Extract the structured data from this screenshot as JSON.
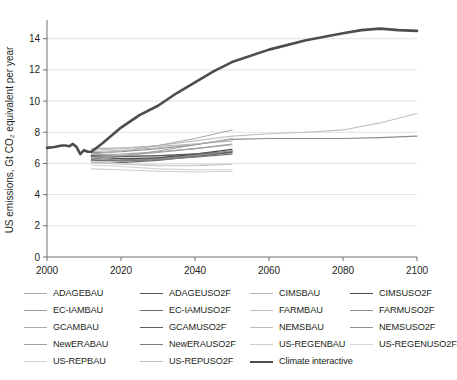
{
  "chart_data": {
    "type": "line",
    "title": "",
    "xlabel": "",
    "ylabel": "US emissions, Gt CO₂ equivalent per year",
    "xlim": [
      2000,
      2100
    ],
    "ylim": [
      0,
      15.2
    ],
    "xticks": [
      2000,
      2020,
      2040,
      2060,
      2080,
      2100
    ],
    "yticks": [
      0,
      2,
      4,
      6,
      8,
      10,
      12,
      14
    ],
    "grid": true,
    "legend_position": "bottom",
    "legend_columns": 4,
    "series": [
      {
        "name": "ADAGEBAU",
        "color": "#a8a8a8",
        "width": 1.1,
        "x": [
          2012,
          2020,
          2030,
          2040,
          2050
        ],
        "values": [
          6.55,
          6.6,
          6.75,
          6.95,
          7.2
        ]
      },
      {
        "name": "ADAGEUSO2F",
        "color": "#555555",
        "width": 1.4,
        "x": [
          2012,
          2020,
          2030,
          2040,
          2050
        ],
        "values": [
          6.45,
          6.3,
          6.35,
          6.5,
          6.75
        ]
      },
      {
        "name": "CIMSBAU",
        "color": "#b4b4b4",
        "width": 1.1,
        "x": [
          2012,
          2020,
          2030,
          2040,
          2050
        ],
        "values": [
          6.95,
          7.0,
          7.1,
          7.25,
          7.45
        ]
      },
      {
        "name": "CIMSUSO2F",
        "color": "#4a4a4a",
        "width": 1.4,
        "x": [
          2012,
          2020,
          2030,
          2040,
          2050
        ],
        "values": [
          6.2,
          6.2,
          6.35,
          6.6,
          6.9
        ]
      },
      {
        "name": "EC-IAMBAU",
        "color": "#9e9e9e",
        "width": 1.1,
        "x": [
          2012,
          2020,
          2030,
          2040,
          2050
        ],
        "values": [
          6.3,
          6.45,
          6.8,
          7.2,
          7.6
        ]
      },
      {
        "name": "EC-IAMUSO2F",
        "color": "#6b6b6b",
        "width": 1.2,
        "x": [
          2012,
          2020,
          2030,
          2040,
          2050
        ],
        "values": [
          6.1,
          6.05,
          6.2,
          6.45,
          6.7
        ]
      },
      {
        "name": "FARMBAU",
        "color": "#c0c0c0",
        "width": 1.1,
        "x": [
          2012,
          2020,
          2030,
          2040,
          2050,
          2060,
          2070,
          2080,
          2090,
          2100
        ],
        "values": [
          6.85,
          6.95,
          7.15,
          7.45,
          7.75,
          7.9,
          8.0,
          8.15,
          8.6,
          9.2
        ]
      },
      {
        "name": "FARMUSO2F",
        "color": "#8c8c8c",
        "width": 1.2,
        "x": [
          2012,
          2020,
          2030,
          2040,
          2050,
          2060,
          2070,
          2080,
          2090,
          2100
        ],
        "values": [
          6.7,
          6.75,
          6.95,
          7.2,
          7.55,
          7.6,
          7.6,
          7.6,
          7.65,
          7.75
        ]
      },
      {
        "name": "GCAMBAU",
        "color": "#ababab",
        "width": 1.1,
        "x": [
          2012,
          2020,
          2030,
          2040,
          2050
        ],
        "values": [
          6.6,
          6.8,
          7.15,
          7.6,
          8.15
        ]
      },
      {
        "name": "GCAMUSO2F",
        "color": "#5f5f5f",
        "width": 1.5,
        "x": [
          2012,
          2020,
          2030,
          2040,
          2050
        ],
        "values": [
          6.5,
          6.45,
          6.5,
          6.6,
          6.75
        ]
      },
      {
        "name": "NEMSBAU",
        "color": "#bdbdbd",
        "width": 1.1,
        "x": [
          2012,
          2020,
          2030,
          2040,
          2050
        ],
        "values": [
          6.75,
          6.85,
          7.0,
          7.25,
          7.55
        ]
      },
      {
        "name": "NEMSUSO2F",
        "color": "#8f8f8f",
        "width": 1.2,
        "x": [
          2012,
          2020,
          2030,
          2040,
          2050
        ],
        "values": [
          6.35,
          6.2,
          6.3,
          6.5,
          6.8
        ]
      },
      {
        "name": "NewERABAU",
        "color": "#a0a0a0",
        "width": 1.1,
        "x": [
          2012,
          2020,
          2030,
          2040,
          2050
        ],
        "values": [
          6.4,
          6.5,
          6.7,
          6.95,
          7.25
        ]
      },
      {
        "name": "NewERAUSO2F",
        "color": "#7a7a7a",
        "width": 1.2,
        "x": [
          2012,
          2020,
          2030,
          2040,
          2050
        ],
        "values": [
          6.25,
          6.15,
          6.25,
          6.4,
          6.6
        ]
      },
      {
        "name": "US-REGENBAU",
        "color": "#cdcdcd",
        "width": 1.1,
        "x": [
          2012,
          2020,
          2030,
          2040,
          2050
        ],
        "values": [
          5.65,
          5.6,
          5.5,
          5.45,
          5.5
        ]
      },
      {
        "name": "US-REPBAU",
        "color": "#d2d2d2",
        "width": 1.1,
        "x": [
          2012,
          2020,
          2030,
          2040,
          2050
        ],
        "values": [
          5.9,
          5.8,
          5.65,
          5.6,
          5.6
        ]
      },
      {
        "name": "US-REPUSO2F",
        "color": "#bfbfbf",
        "width": 1.1,
        "x": [
          2012,
          2020,
          2030,
          2040,
          2050
        ],
        "values": [
          6.05,
          5.95,
          5.85,
          5.85,
          5.95
        ]
      },
      {
        "name": "US-REGENUSO2F",
        "color": "#d8d8d8",
        "width": 1.1,
        "x": [
          2012,
          2020,
          2030,
          2040,
          2050
        ],
        "values": [
          6.15,
          6.0,
          5.9,
          5.9,
          6.0
        ]
      },
      {
        "name": "Climate interactive",
        "color": "#4d4d4d",
        "width": 2.6,
        "x": [
          2000,
          2002,
          2004,
          2005,
          2006,
          2007,
          2008,
          2009,
          2010,
          2011,
          2012,
          2015,
          2020,
          2025,
          2030,
          2035,
          2040,
          2045,
          2050,
          2060,
          2070,
          2080,
          2085,
          2090,
          2095,
          2100
        ],
        "values": [
          7.0,
          7.05,
          7.15,
          7.15,
          7.1,
          7.25,
          7.05,
          6.6,
          6.85,
          6.75,
          6.75,
          7.3,
          8.3,
          9.1,
          9.7,
          10.5,
          11.2,
          11.9,
          12.5,
          13.3,
          13.9,
          14.35,
          14.55,
          14.65,
          14.55,
          14.5
        ]
      }
    ]
  },
  "legend": {
    "columns": [
      {
        "items": [
          "ADAGEBAU",
          "EC-IAMBAU",
          "GCAMBAU",
          "NewERABAU",
          "US-REPBAU"
        ]
      },
      {
        "items": [
          "ADAGEUSO2F",
          "EC-IAMUSO2F",
          "GCAMUSO2F",
          "NewERAUSO2F",
          "US-REPUSO2F"
        ]
      },
      {
        "items": [
          "CIMSBAU",
          "FARMBAU",
          "NEMSBAU",
          "US-REGENBAU",
          "Climate interactive"
        ]
      },
      {
        "items": [
          "CIMSUSO2F",
          "FARMUSO2F",
          "NEMSUSO2F",
          "US-REGENUSO2F"
        ]
      }
    ]
  }
}
